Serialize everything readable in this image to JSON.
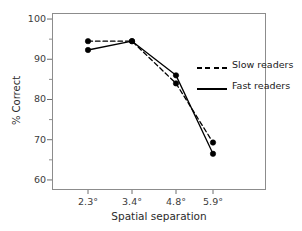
{
  "chart_data": {
    "type": "line",
    "title": "",
    "xlabel": "Spatial separation",
    "ylabel": "% Correct",
    "categories": [
      "2.3°",
      "3.4°",
      "4.8°",
      "5.9°"
    ],
    "x_tick_labels": [
      "2.3°",
      "3.4°",
      "4.8°",
      "5.9°"
    ],
    "y_tick_labels": [
      "100",
      "90",
      "80",
      "70",
      "60"
    ],
    "y_major_ticks": [
      100,
      90,
      80,
      70,
      60
    ],
    "y_minor_ticks": [
      95,
      85,
      75,
      65
    ],
    "ylim": [
      57.5,
      101.5
    ],
    "grid": false,
    "legend_position": "right",
    "series": [
      {
        "name": "Slow readers",
        "style": "dashed",
        "color": "#000000",
        "marker": "filled-circle",
        "values": [
          94.5,
          94.5,
          84.0,
          69.3
        ]
      },
      {
        "name": "Fast readers",
        "style": "solid",
        "color": "#000000",
        "marker": "filled-circle",
        "values": [
          92.3,
          94.5,
          86.0,
          66.5
        ]
      }
    ]
  },
  "legend": {
    "items": [
      {
        "label": "Slow readers",
        "style": "dashed"
      },
      {
        "label": "Fast readers",
        "style": "solid"
      }
    ]
  },
  "axes": {
    "y_title": "% Correct",
    "x_title": "Spatial separation"
  }
}
